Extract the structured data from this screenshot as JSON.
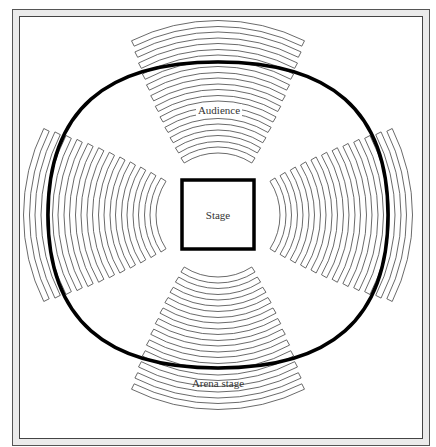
{
  "diagram": {
    "caption": "Arena stage",
    "stage_label": "Stage",
    "audience_label": "Audience",
    "sections": [
      {
        "name": "top",
        "rows": 12
      },
      {
        "name": "right",
        "rows": 12
      },
      {
        "name": "bottom",
        "rows": 12
      },
      {
        "name": "left",
        "rows": 12
      }
    ],
    "colors": {
      "outline": "#000000",
      "rows": "#444444",
      "frame_bg": "#ebebeb"
    }
  }
}
